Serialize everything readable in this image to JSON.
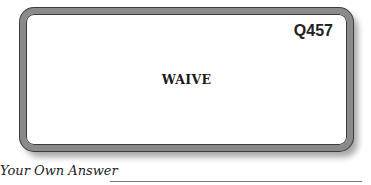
{
  "card": {
    "question_id": "Q457",
    "word": "WAIVE"
  },
  "answer": {
    "label": "Your Own Answer"
  }
}
